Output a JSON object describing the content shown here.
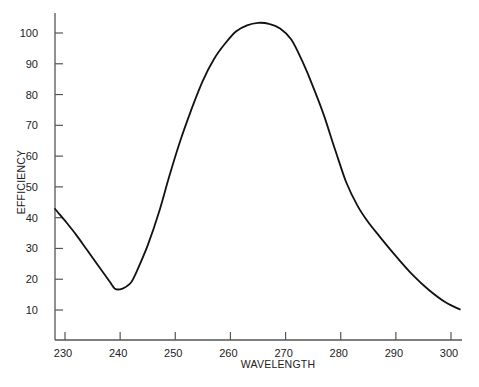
{
  "chart_data": {
    "type": "line",
    "title": "",
    "xlabel": "WAVELENGTH",
    "ylabel": "EFFICIENCY",
    "xlim": [
      228.2,
      302.0
    ],
    "ylim": [
      0,
      105
    ],
    "grid": false,
    "legend": null,
    "x_ticks": [
      230,
      240,
      250,
      260,
      270,
      280,
      290,
      300
    ],
    "y_ticks": [
      10,
      20,
      30,
      40,
      50,
      60,
      70,
      80,
      90,
      100
    ],
    "series": [
      {
        "name": "efficiency",
        "color": "#111111",
        "x": [
          228.2,
          230,
          232,
          234,
          236,
          238,
          239,
          240,
          241,
          242,
          243,
          245,
          247,
          249,
          251,
          253,
          255,
          257,
          259,
          261,
          263,
          265,
          267,
          269,
          271,
          273,
          275,
          277,
          279,
          281,
          283,
          285,
          287,
          290,
          293,
          296,
          299,
          301.6
        ],
        "values": [
          42.8,
          39,
          34.5,
          29.5,
          24.5,
          19.5,
          17,
          16.7,
          17.5,
          19,
          22.5,
          31,
          41.5,
          54,
          65.5,
          75.5,
          84.5,
          91.5,
          96.5,
          100.5,
          102.5,
          103.3,
          103,
          101.5,
          98,
          91,
          82.5,
          73,
          62,
          51.5,
          44,
          38.5,
          34,
          27.5,
          21.5,
          16.5,
          12.5,
          10.2
        ]
      }
    ]
  }
}
